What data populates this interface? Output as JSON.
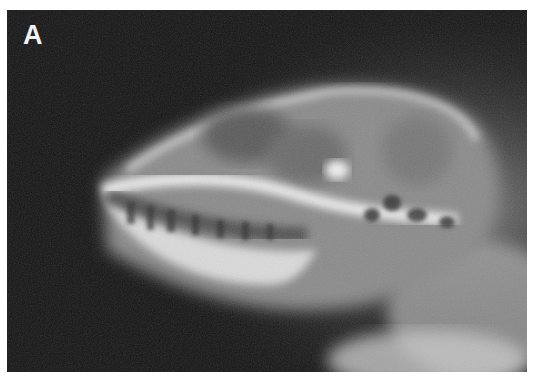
{
  "figure": {
    "panel_label": "A",
    "colors": {
      "background": "#141414",
      "bone_bright": "#e8e8e8",
      "bone_mid": "#9a9a9a",
      "page": "#ffffff"
    }
  }
}
